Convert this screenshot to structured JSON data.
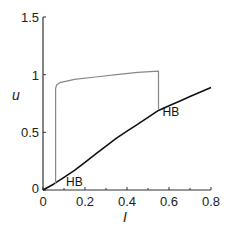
{
  "chart_data": {
    "type": "line",
    "title": "",
    "xlabel": "I",
    "ylabel": "u",
    "xlim": [
      0,
      0.8
    ],
    "ylim": [
      0,
      1.5
    ],
    "xticks": [
      0,
      0.2,
      0.4,
      0.6,
      0.8
    ],
    "xtick_labels": [
      "0",
      "0.2",
      "0.4",
      "0.6",
      "0.8"
    ],
    "xminor_ticks": [
      0.1,
      0.3,
      0.5,
      0.7
    ],
    "yticks": [
      0,
      0.5,
      1,
      1.5
    ],
    "ytick_labels": [
      "0",
      "0.5",
      "1",
      "1.5"
    ],
    "grid": false,
    "series": [
      {
        "name": "steady state",
        "color": "#111111",
        "x": [
          0,
          0.05,
          0.1,
          0.15,
          0.2,
          0.25,
          0.3,
          0.35,
          0.4,
          0.45,
          0.5,
          0.55,
          0.6,
          0.65,
          0.7,
          0.75,
          0.8
        ],
        "y": [
          0,
          0.05,
          0.11,
          0.17,
          0.24,
          0.31,
          0.38,
          0.45,
          0.51,
          0.57,
          0.63,
          0.69,
          0.73,
          0.77,
          0.81,
          0.85,
          0.89
        ]
      },
      {
        "name": "oscillation max",
        "color": "#888888",
        "x": [
          0.06,
          0.06,
          0.065,
          0.08,
          0.15,
          0.25,
          0.35,
          0.45,
          0.55,
          0.55
        ],
        "y": [
          0.05,
          0.88,
          0.91,
          0.93,
          0.96,
          0.98,
          1.0,
          1.02,
          1.03,
          0.7
        ]
      }
    ],
    "annotations": [
      {
        "text": "HB",
        "x": 0.1,
        "y": 0.02
      },
      {
        "text": "HB",
        "x": 0.56,
        "y": 0.62
      }
    ]
  }
}
